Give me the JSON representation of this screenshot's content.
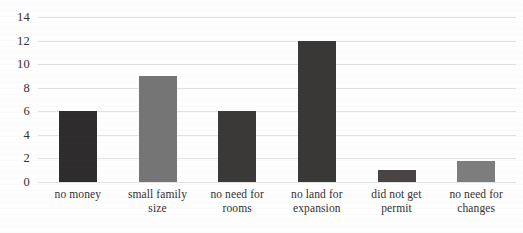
{
  "chart_data": {
    "type": "bar",
    "title": "",
    "subtitle": "",
    "xlabel": "",
    "ylabel": "",
    "categories": [
      "no money",
      "small family size",
      "no need for rooms",
      "no land for expansion",
      "did not get permit",
      "no need for changes"
    ],
    "category_lines": [
      [
        "no money"
      ],
      [
        "small family size"
      ],
      [
        "no need for rooms"
      ],
      [
        "no land for",
        "expansion"
      ],
      [
        "did not get permit"
      ],
      [
        "no need for",
        "changes"
      ]
    ],
    "values": [
      6,
      9,
      6,
      12,
      1,
      1.8
    ],
    "bar_colors": [
      "#2e2c2c",
      "#757575",
      "#3b3938",
      "#3a3837",
      "#474443",
      "#7d7d7d"
    ],
    "ylim": [
      0,
      14
    ],
    "yticks": [
      0,
      2,
      4,
      6,
      8,
      10,
      12,
      14
    ],
    "ytick_labels": [
      "0",
      "2",
      "4",
      "6",
      "8",
      "10",
      "12",
      "14"
    ],
    "grid": true,
    "grid_color": "#e2e2e2",
    "legend": "none",
    "axis_lines": "none",
    "background_color": "#ffffff"
  }
}
